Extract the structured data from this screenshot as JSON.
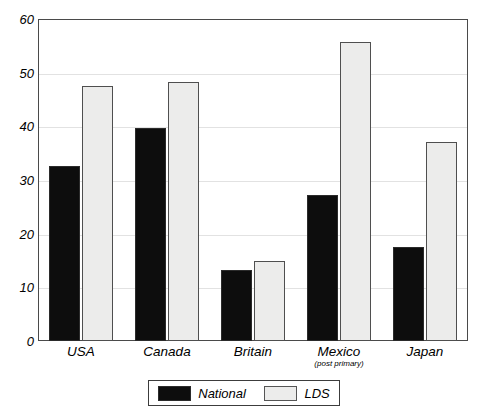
{
  "chart_data": {
    "type": "bar",
    "title": "",
    "subtitle": "",
    "xlabel": "",
    "ylabel": "",
    "categories": [
      "USA",
      "Canada",
      "Britain",
      "Mexico",
      "Japan"
    ],
    "category_sublabels": [
      "",
      "",
      "",
      "(post primary)",
      ""
    ],
    "series": [
      {
        "name": "National",
        "color": "#0d0d0d",
        "values": [
          32.6,
          39.7,
          13.2,
          27.2,
          17.5
        ]
      },
      {
        "name": "LDS",
        "color": "#ececeb",
        "values": [
          47.5,
          48.2,
          14.9,
          55.7,
          37.1
        ]
      }
    ],
    "ylim": [
      0,
      60
    ],
    "yticks": [
      0,
      10,
      20,
      30,
      40,
      50,
      60
    ],
    "ytick_labels": [
      "0",
      "10",
      "20",
      "30",
      "40",
      "50",
      "60"
    ],
    "grid": true,
    "grid_axis": "y",
    "legend_position": "bottom-center",
    "legend_entries": [
      "National",
      "LDS"
    ]
  },
  "axis": {
    "y": {
      "ticks": [
        {
          "label": "60",
          "value": 60
        },
        {
          "label": "50",
          "value": 50
        },
        {
          "label": "40",
          "value": 40
        },
        {
          "label": "30",
          "value": 30
        },
        {
          "label": "20",
          "value": 20
        },
        {
          "label": "10",
          "value": 10
        },
        {
          "label": "0",
          "value": 0
        }
      ]
    },
    "x": {
      "groups": [
        {
          "label": "USA",
          "sub": ""
        },
        {
          "label": "Canada",
          "sub": ""
        },
        {
          "label": "Britain",
          "sub": ""
        },
        {
          "label": "Mexico",
          "sub": "(post primary)"
        },
        {
          "label": "Japan",
          "sub": ""
        }
      ]
    }
  },
  "legend": {
    "items": [
      {
        "label": "National",
        "swatch": "national"
      },
      {
        "label": "LDS",
        "swatch": "lds"
      }
    ]
  },
  "colors": {
    "national": "#0d0d0d",
    "lds": "#ececeb",
    "frame": "#4a4a4a",
    "grid": "#e2e2e2",
    "text": "#000000",
    "background": "#ffffff"
  }
}
